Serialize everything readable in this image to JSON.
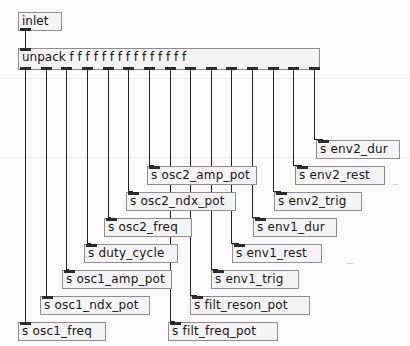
{
  "patch": {
    "kind": "pure-data-patch",
    "canvas": {
      "width": 410,
      "height": 346,
      "background": "#fbfbfb"
    },
    "colors": {
      "box_fill": "#f4f4f4",
      "box_border": "#8e8e8e",
      "text": "#161616",
      "cord": "#232323",
      "nub": "#2b2b2b"
    }
  },
  "inlet": {
    "label": "inlet",
    "x": 18,
    "y": 12,
    "w": 44,
    "h": 19,
    "outlets": 1
  },
  "unpack": {
    "label": "unpack f f f f f f f f f f f f f f f",
    "name": "unpack",
    "arg": "f",
    "arg_count": 15,
    "x": 18,
    "y": 48,
    "w": 302,
    "h": 22,
    "inlets": 1,
    "outlets": 15
  },
  "sends": [
    {
      "label": "s osc1_freq",
      "symbol": "osc1_freq",
      "x": 18,
      "y": 322,
      "w": 88,
      "h": 19,
      "outlet_index": 0
    },
    {
      "label": "s osc1_ndx_pot",
      "symbol": "osc1_ndx_pot",
      "x": 40,
      "y": 296,
      "w": 110,
      "h": 19,
      "outlet_index": 1
    },
    {
      "label": "s osc1_amp_pot",
      "symbol": "osc1_amp_pot",
      "x": 62,
      "y": 270,
      "w": 110,
      "h": 19,
      "outlet_index": 2
    },
    {
      "label": "s duty_cycle",
      "symbol": "duty_cycle",
      "x": 84,
      "y": 244,
      "w": 94,
      "h": 19,
      "outlet_index": 3
    },
    {
      "label": "s osc2_freq",
      "symbol": "osc2_freq",
      "x": 104,
      "y": 218,
      "w": 88,
      "h": 19,
      "outlet_index": 4
    },
    {
      "label": "s osc2_ndx_pot",
      "symbol": "osc2_ndx_pot",
      "x": 126,
      "y": 192,
      "w": 110,
      "h": 19,
      "outlet_index": 5
    },
    {
      "label": "s osc2_amp_pot",
      "symbol": "osc2_amp_pot",
      "x": 147,
      "y": 166,
      "w": 110,
      "h": 19,
      "outlet_index": 6
    },
    {
      "label": "s filt_freq_pot",
      "symbol": "filt_freq_pot",
      "x": 168,
      "y": 322,
      "w": 110,
      "h": 19,
      "outlet_index": 7
    },
    {
      "label": "s filt_reson_pot",
      "symbol": "filt_reson_pot",
      "x": 190,
      "y": 296,
      "w": 120,
      "h": 19,
      "outlet_index": 8
    },
    {
      "label": "s env1_trig",
      "symbol": "env1_trig",
      "x": 211,
      "y": 270,
      "w": 88,
      "h": 19,
      "outlet_index": 9
    },
    {
      "label": "s env1_rest",
      "symbol": "env1_rest",
      "x": 232,
      "y": 244,
      "w": 90,
      "h": 19,
      "outlet_index": 10
    },
    {
      "label": "s env1_dur",
      "symbol": "env1_dur",
      "x": 253,
      "y": 218,
      "w": 84,
      "h": 19,
      "outlet_index": 11
    },
    {
      "label": "s env2_trig",
      "symbol": "env2_trig",
      "x": 274,
      "y": 192,
      "w": 88,
      "h": 19,
      "outlet_index": 12
    },
    {
      "label": "s env2_rest",
      "symbol": "env2_rest",
      "x": 295,
      "y": 166,
      "w": 90,
      "h": 19,
      "outlet_index": 13
    },
    {
      "label": "s env2_dur",
      "symbol": "env2_dur",
      "x": 316,
      "y": 140,
      "w": 84,
      "h": 19,
      "outlet_index": 14
    }
  ]
}
